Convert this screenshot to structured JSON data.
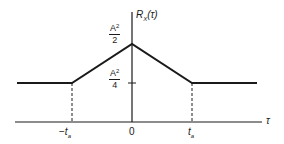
{
  "diagram": {
    "y_axis_label": {
      "base": "R",
      "sub": "X",
      "arg": "(τ)"
    },
    "x_axis_label": "τ",
    "x_ticks": {
      "neg": {
        "sign": "−",
        "base": "t",
        "sub": "a"
      },
      "zero": "0",
      "pos": {
        "base": "t",
        "sub": "a"
      }
    },
    "y_ticks": {
      "peak": {
        "num_base": "A",
        "num_exp": "2",
        "den": "2"
      },
      "plateau": {
        "num_base": "A",
        "num_exp": "2",
        "den": "4"
      }
    },
    "colors": {
      "line": "#1a1a1a",
      "background": "#ffffff"
    },
    "curve_points": [
      {
        "tau": "-inf",
        "value": "A^2/4"
      },
      {
        "tau": "-t_a",
        "value": "A^2/4"
      },
      {
        "tau": "0",
        "value": "A^2/2"
      },
      {
        "tau": "t_a",
        "value": "A^2/4"
      },
      {
        "tau": "+inf",
        "value": "A^2/4"
      }
    ]
  }
}
